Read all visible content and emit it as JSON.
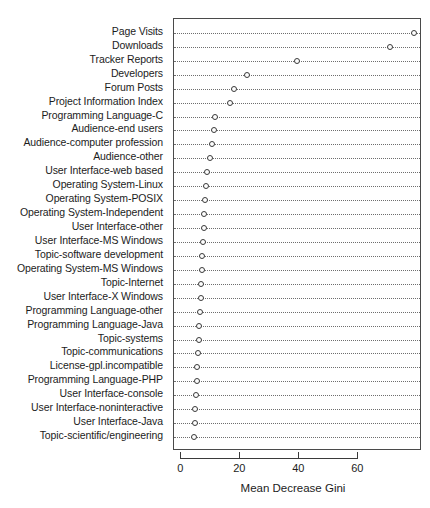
{
  "chart_data": {
    "type": "scatter",
    "title": "",
    "xlabel": "Mean Decrease Gini",
    "ylabel": "",
    "xlim": [
      -2.5,
      81.6
    ],
    "xticks": [
      0,
      20,
      40,
      60
    ],
    "xtick_labels": [
      "0",
      "20",
      "40",
      "60"
    ],
    "grid": "horizontal-dotted",
    "legend": "none",
    "orientation": "horizontal-dotplot",
    "marker": "open-circle",
    "categories": [
      "Page Visits",
      "Downloads",
      "Tracker Reports",
      "Developers",
      "Forum Posts",
      "Project Information Index",
      "Programming Language-C",
      "Audience-end users",
      "Audience-computer profession",
      "Audience-other",
      "User Interface-web based",
      "Operating System-Linux",
      "Operating System-POSIX",
      "Operating System-Independent",
      "User Interface-other",
      "User Interface-MS Windows",
      "Topic-software development",
      "Operating System-MS Windows",
      "Topic-Internet",
      "User Interface-X Windows",
      "Programming Language-other",
      "Programming Language-Java",
      "Topic-systems",
      "Topic-communications",
      "License-gpl.incompatible",
      "Programming Language-PHP",
      "User Interface-console",
      "User Interface-noninteractive",
      "User Interface-Java",
      "Topic-scientific/engineering"
    ],
    "values": [
      79.0,
      70.8,
      39.3,
      22.3,
      17.9,
      16.6,
      11.4,
      10.9,
      10.4,
      9.6,
      8.8,
      8.3,
      8.1,
      7.8,
      7.6,
      7.3,
      7.1,
      7.0,
      6.8,
      6.6,
      6.3,
      6.1,
      5.9,
      5.7,
      5.4,
      5.2,
      5.0,
      4.7,
      4.5,
      4.2
    ]
  },
  "axis": {
    "x_title": "Mean Decrease Gini"
  }
}
